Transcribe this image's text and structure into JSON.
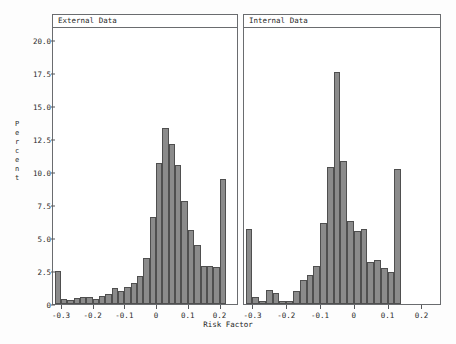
{
  "chart_data": {
    "type": "bar",
    "title": "",
    "xlabel": "Risk Factor",
    "ylabel": "Percent",
    "ylim": [
      0,
      20.0
    ],
    "xlim": [
      -0.325,
      0.255
    ],
    "grid": false,
    "legend": null,
    "bin_width": 0.02,
    "yticks": [
      "0",
      "2.5",
      "5.0",
      "7.5",
      "10.0",
      "12.5",
      "15.0",
      "17.5",
      "20.0"
    ],
    "ytick_values": [
      0,
      2.5,
      5.0,
      7.5,
      10.0,
      12.5,
      15.0,
      17.5,
      20.0
    ],
    "xticks": [
      "-0.3",
      "-0.2",
      "-0.1",
      "0",
      "0.1",
      "0.2"
    ],
    "xtick_values": [
      -0.3,
      -0.2,
      -0.1,
      0,
      0.1,
      0.2
    ],
    "panels": [
      {
        "label": "External Data",
        "bin_centers": [
          -0.31,
          -0.29,
          -0.27,
          -0.25,
          -0.23,
          -0.21,
          -0.19,
          -0.17,
          -0.15,
          -0.13,
          -0.11,
          -0.09,
          -0.07,
          -0.05,
          -0.03,
          -0.01,
          0.01,
          0.03,
          0.05,
          0.07,
          0.09,
          0.11,
          0.13,
          0.15,
          0.17,
          0.19,
          0.21,
          0.23,
          0.25
        ],
        "values": [
          2.5,
          0.35,
          0.3,
          0.45,
          0.55,
          0.55,
          0.35,
          0.6,
          0.75,
          1.2,
          1.0,
          1.3,
          1.6,
          2.1,
          3.5,
          6.6,
          10.7,
          13.3,
          12.1,
          10.5,
          7.8,
          5.6,
          4.5,
          2.9,
          2.85,
          2.8,
          9.5
        ]
      },
      {
        "label": "Internal Data",
        "bin_centers": [
          -0.31,
          -0.29,
          -0.27,
          -0.25,
          -0.23,
          -0.21,
          -0.19,
          -0.17,
          -0.15,
          -0.13,
          -0.11,
          -0.09,
          -0.07,
          -0.05,
          -0.03,
          -0.01,
          0.01,
          0.03,
          0.05,
          0.07,
          0.09,
          0.11,
          0.13,
          0.15,
          0.17,
          0.19,
          0.21,
          0.23,
          0.25
        ],
        "values": [
          5.7,
          0.5,
          0.25,
          1.05,
          0.85,
          0.2,
          0.2,
          0.95,
          1.8,
          2.2,
          2.9,
          6.1,
          10.4,
          17.6,
          10.8,
          6.3,
          5.5,
          5.7,
          3.2,
          3.35,
          2.75,
          2.4,
          10.2
        ]
      }
    ]
  },
  "axes": {
    "ylabel_letters": [
      "P",
      "e",
      "r",
      "c",
      "e",
      "n",
      "t"
    ]
  }
}
